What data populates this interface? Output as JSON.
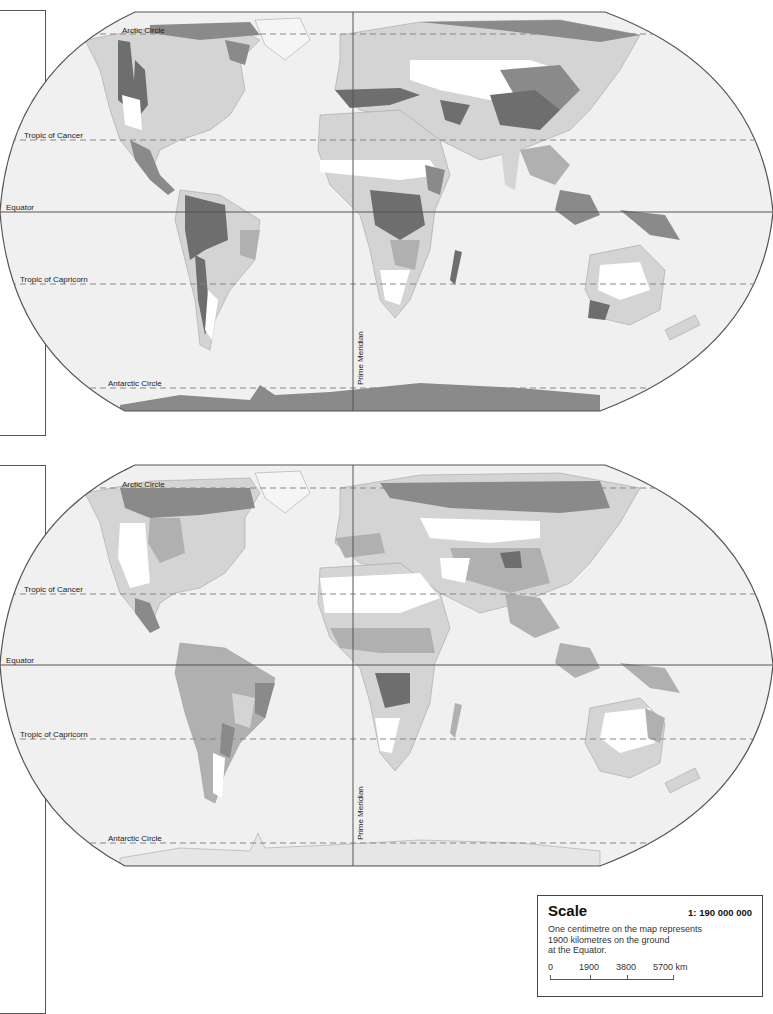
{
  "maps": [
    {
      "id": "map-top",
      "lines": {
        "arctic_circle": "Arctic Circle",
        "tropic_of_cancer": "Tropic of Cancer",
        "equator": "Equator",
        "tropic_of_capricorn": "Tropic of Capricorn",
        "antarctic_circle": "Antarctic Circle",
        "prime_meridian": "Prime Meridian"
      }
    },
    {
      "id": "map-bottom",
      "lines": {
        "arctic_circle": "Arctic Circle",
        "tropic_of_cancer": "Tropic of Cancer",
        "equator": "Equator",
        "tropic_of_capricorn": "Tropic of Capricorn",
        "antarctic_circle": "Antarctic Circle",
        "prime_meridian": "Prime Meridian"
      }
    }
  ],
  "colors": {
    "ocean": "#f0f0f0",
    "land_light": "#d4d4d4",
    "land_mid": "#b0b0b0",
    "land_dark": "#8a8a8a",
    "land_darkest": "#6e6e6e",
    "land_white": "#ffffff",
    "frame": "#555555"
  },
  "scale": {
    "title": "Scale",
    "ratio": "1: 190 000 000",
    "description_line1": "One centimetre on the map represents",
    "description_line2": "1900 kilometres on the ground",
    "description_line3": "at the Equator.",
    "ticks": [
      "0",
      "1900",
      "3800",
      "5700 km"
    ]
  }
}
